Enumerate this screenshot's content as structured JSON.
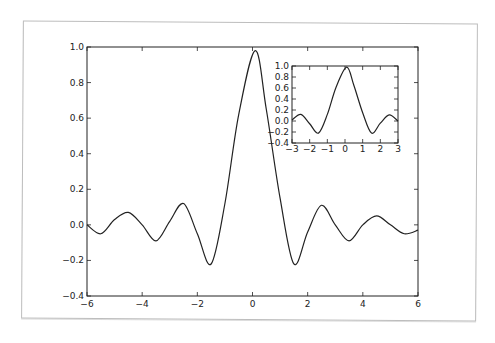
{
  "chart_data": [
    {
      "type": "line",
      "title": "",
      "xlabel": "",
      "ylabel": "",
      "xlim": [
        -6,
        6
      ],
      "ylim": [
        -0.4,
        1.0
      ],
      "xticks": [
        -6,
        -4,
        -2,
        0,
        2,
        4,
        6
      ],
      "yticks": [
        -0.4,
        -0.2,
        0.0,
        0.2,
        0.4,
        0.6,
        0.8,
        1.0
      ],
      "xtick_labels": [
        "−6",
        "−4",
        "−2",
        "0",
        "2",
        "4",
        "6"
      ],
      "ytick_labels": [
        "−0.4",
        "−0.2",
        "0.0",
        "0.2",
        "0.4",
        "0.6",
        "0.8",
        "1.0"
      ],
      "grid": false,
      "series": [
        {
          "name": "main",
          "color": "#222222",
          "x": [
            -6,
            -5.5,
            -5,
            -4.5,
            -4,
            -3.5,
            -3,
            -2.5,
            -2,
            -1.5,
            -1,
            -0.5,
            0.1,
            0.5,
            1,
            1.5,
            2,
            2.5,
            3,
            3.5,
            4,
            4.5,
            5,
            5.5,
            6
          ],
          "y": [
            0.0,
            -0.05,
            0.03,
            0.07,
            0.0,
            -0.09,
            0.02,
            0.12,
            -0.05,
            -0.22,
            0.12,
            0.62,
            0.98,
            0.65,
            0.15,
            -0.22,
            -0.04,
            0.11,
            0.0,
            -0.09,
            0.0,
            0.05,
            0.0,
            -0.05,
            -0.03
          ]
        }
      ]
    },
    {
      "type": "line",
      "title": "",
      "xlabel": "",
      "ylabel": "",
      "position": "inset top-right",
      "xlim": [
        -3,
        3
      ],
      "ylim": [
        -0.4,
        1.0
      ],
      "xticks": [
        -3,
        -2,
        -1,
        0,
        1,
        2,
        3
      ],
      "yticks": [
        -0.4,
        -0.2,
        0.0,
        0.2,
        0.4,
        0.6,
        0.8,
        1.0
      ],
      "xtick_labels": [
        "−3",
        "−2",
        "−1",
        "0",
        "1",
        "2",
        "3"
      ],
      "ytick_labels": [
        "−0.4",
        "−0.2",
        "0.0",
        "0.2",
        "0.4",
        "0.6",
        "0.8",
        "1.0"
      ],
      "grid": false,
      "series": [
        {
          "name": "inset",
          "color": "#222222",
          "x": [
            -3,
            -2.5,
            -2,
            -1.5,
            -1,
            -0.5,
            0.1,
            0.5,
            1,
            1.5,
            2,
            2.5,
            3
          ],
          "y": [
            0.02,
            0.12,
            -0.05,
            -0.22,
            0.12,
            0.62,
            0.98,
            0.65,
            0.15,
            -0.22,
            -0.04,
            0.11,
            0.0
          ]
        }
      ]
    }
  ]
}
